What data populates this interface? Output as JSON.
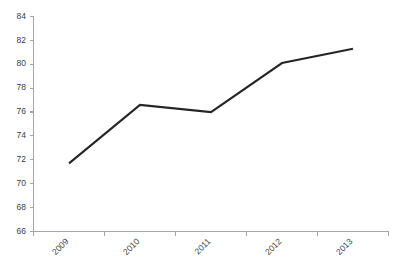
{
  "chart_data": {
    "type": "line",
    "title": "",
    "subtitle": "",
    "xlabel": "",
    "ylabel": "",
    "categories": [
      "2009",
      "2010",
      "2011",
      "2012",
      "2013"
    ],
    "series": [
      {
        "name": "Series 1",
        "values": [
          71.7,
          76.6,
          76.0,
          80.1,
          81.3
        ]
      }
    ],
    "ylim": [
      66,
      84
    ],
    "ytick_step": 2,
    "ytick_labels": [
      "66",
      "68",
      "70",
      "72",
      "74",
      "76",
      "78",
      "80",
      "82",
      "84"
    ],
    "ytick_values": [
      66,
      68,
      70,
      72,
      74,
      76,
      78,
      80,
      82,
      84
    ],
    "xtick_labels": [
      "2009",
      "2010",
      "2011",
      "2012",
      "2013"
    ],
    "xtick_label_rotation": -45,
    "grid": false,
    "legend": false,
    "legend_position": "none",
    "annotations": [],
    "colors": {
      "line": "#262626",
      "axis": "#a6a6a6",
      "tick_text": "#3d3d3d",
      "background": "#ffffff"
    }
  },
  "axes": {
    "y_axis_name": "value-axis",
    "x_axis_name": "category-axis"
  }
}
